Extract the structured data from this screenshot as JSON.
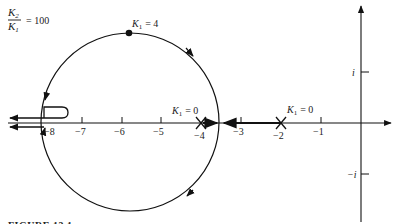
{
  "diagram": {
    "type": "root-locus",
    "ratio_label": {
      "numerator": "K",
      "numerator_sub": "2",
      "denominator": "K",
      "denominator_sub": "1",
      "equals": "= 100"
    },
    "top_point_label": {
      "k": "K",
      "sub": "1",
      "value": "= 4"
    },
    "pole_labels": [
      {
        "k": "K",
        "sub": "1",
        "value": "= 0",
        "at": -4
      },
      {
        "k": "K",
        "sub": "1",
        "value": "= 0",
        "at": -2
      }
    ],
    "real_axis_ticks": [
      "−8",
      "−7",
      "−6",
      "−5",
      "−4",
      "−3",
      "−2",
      "−1"
    ],
    "imag_axis_ticks": [
      "i",
      "−i"
    ],
    "caption": "FIGURE 13.1"
  }
}
